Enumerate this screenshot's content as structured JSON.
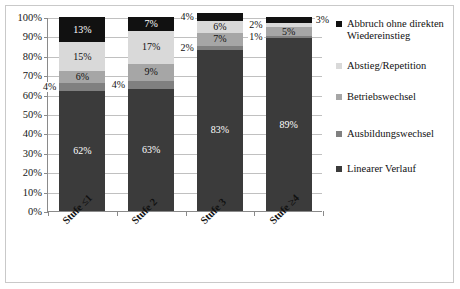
{
  "chart_data": {
    "type": "bar",
    "subtype": "stacked-column-100",
    "title": "",
    "xlabel": "",
    "ylabel": "",
    "ylim": [
      0,
      100
    ],
    "ytick_labels": [
      "100%",
      "90%",
      "80%",
      "70%",
      "60%",
      "50%",
      "40%",
      "30%",
      "20%",
      "10%",
      "0%"
    ],
    "ytick_values": [
      100,
      90,
      80,
      70,
      60,
      50,
      40,
      30,
      20,
      10,
      0
    ],
    "grid": true,
    "legend_position": "right",
    "categories": [
      "Stufe ≤1",
      "Stufe 2",
      "Stufe 3",
      "Stufe ≥4"
    ],
    "series": [
      {
        "name": "Linearer Verlauf",
        "color": "#3b3b3b",
        "values": [
          62,
          63,
          83,
          89
        ],
        "labels": [
          "62%",
          "63%",
          "83%",
          "89%"
        ],
        "label_placement": [
          "inside",
          "inside",
          "inside",
          "inside"
        ]
      },
      {
        "name": "Ausbildungswechsel",
        "color": "#808080",
        "values": [
          4,
          4,
          2,
          1
        ],
        "labels": [
          "4%",
          "4%",
          "2%",
          "1%"
        ],
        "label_placement": [
          "outside-left",
          "outside-left",
          "outside-left",
          "outside-left"
        ]
      },
      {
        "name": "Betriebswechsel",
        "color": "#a6a6a6",
        "values": [
          6,
          9,
          7,
          5
        ],
        "labels": [
          "6%",
          "9%",
          "7%",
          "5%"
        ],
        "label_placement": [
          "inside",
          "inside",
          "inside",
          "inside"
        ]
      },
      {
        "name": "Abstieg/Repetition",
        "color": "#d9d9d9",
        "values": [
          15,
          17,
          6,
          2
        ],
        "labels": [
          "15%",
          "17%",
          "6%",
          "2%"
        ],
        "label_placement": [
          "inside",
          "inside",
          "inside",
          "outside-left"
        ]
      },
      {
        "name": "Abbruch ohne direkten Wiedereinstieg",
        "color": "#111111",
        "values": [
          13,
          7,
          4,
          3
        ],
        "labels": [
          "13%",
          "7%",
          "4%",
          "3%"
        ],
        "label_placement": [
          "inside",
          "inside",
          "outside-left",
          "outside-right"
        ]
      }
    ]
  },
  "legend": {
    "items": [
      {
        "label": "Abbruch ohne direkten Wiedereinstieg",
        "color": "#111111"
      },
      {
        "label": "Abstieg/Repetition",
        "color": "#d9d9d9"
      },
      {
        "label": "Betriebswechsel",
        "color": "#a6a6a6"
      },
      {
        "label": "Ausbildungswechsel",
        "color": "#808080"
      },
      {
        "label": "Linearer Verlauf",
        "color": "#3b3b3b"
      }
    ]
  },
  "colors": {
    "axis": "#8a8a8a",
    "grid": "#c0c0c0",
    "frame": "#c9c9c9",
    "text": "#111111",
    "background": "#ffffff"
  }
}
